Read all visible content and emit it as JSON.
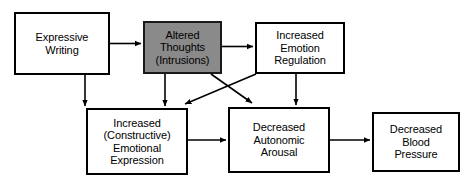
{
  "diagram": {
    "type": "flowchart",
    "title": "",
    "line_color": "#000000",
    "shaded_fill": "#8a8a8a",
    "background": "#ffffff",
    "nodes": [
      {
        "id": "expressive-writing",
        "label": "Expressive\nWriting",
        "shaded": false
      },
      {
        "id": "altered-thoughts",
        "label": "Altered\nThoughts\n(Intrusions)",
        "shaded": true
      },
      {
        "id": "emotion-regulation",
        "label": "Increased\nEmotion\nRegulation",
        "shaded": false
      },
      {
        "id": "emotional-expression",
        "label": "Increased\n(Constructive)\nEmotional\nExpression",
        "shaded": false
      },
      {
        "id": "autonomic-arousal",
        "label": "Decreased\nAutonomic\nArousal",
        "shaded": false
      },
      {
        "id": "blood-pressure",
        "label": "Decreased\nBlood\nPressure",
        "shaded": false
      }
    ],
    "edges": [
      {
        "from": "expressive-writing",
        "to": "altered-thoughts",
        "style": "horizontal-arrow"
      },
      {
        "from": "altered-thoughts",
        "to": "emotion-regulation",
        "style": "horizontal-arrow"
      },
      {
        "from": "expressive-writing",
        "to": "emotional-expression",
        "style": "vertical-arrow"
      },
      {
        "from": "altered-thoughts",
        "to": "emotional-expression",
        "style": "vertical-arrow"
      },
      {
        "from": "emotion-regulation",
        "to": "emotional-expression",
        "style": "diagonal-arrow"
      },
      {
        "from": "altered-thoughts",
        "to": "autonomic-arousal",
        "style": "diagonal-arrow"
      },
      {
        "from": "emotion-regulation",
        "to": "autonomic-arousal",
        "style": "vertical-arrow"
      },
      {
        "from": "emotional-expression",
        "to": "autonomic-arousal",
        "style": "horizontal-arrow"
      },
      {
        "from": "autonomic-arousal",
        "to": "blood-pressure",
        "style": "horizontal-arrow"
      }
    ]
  }
}
